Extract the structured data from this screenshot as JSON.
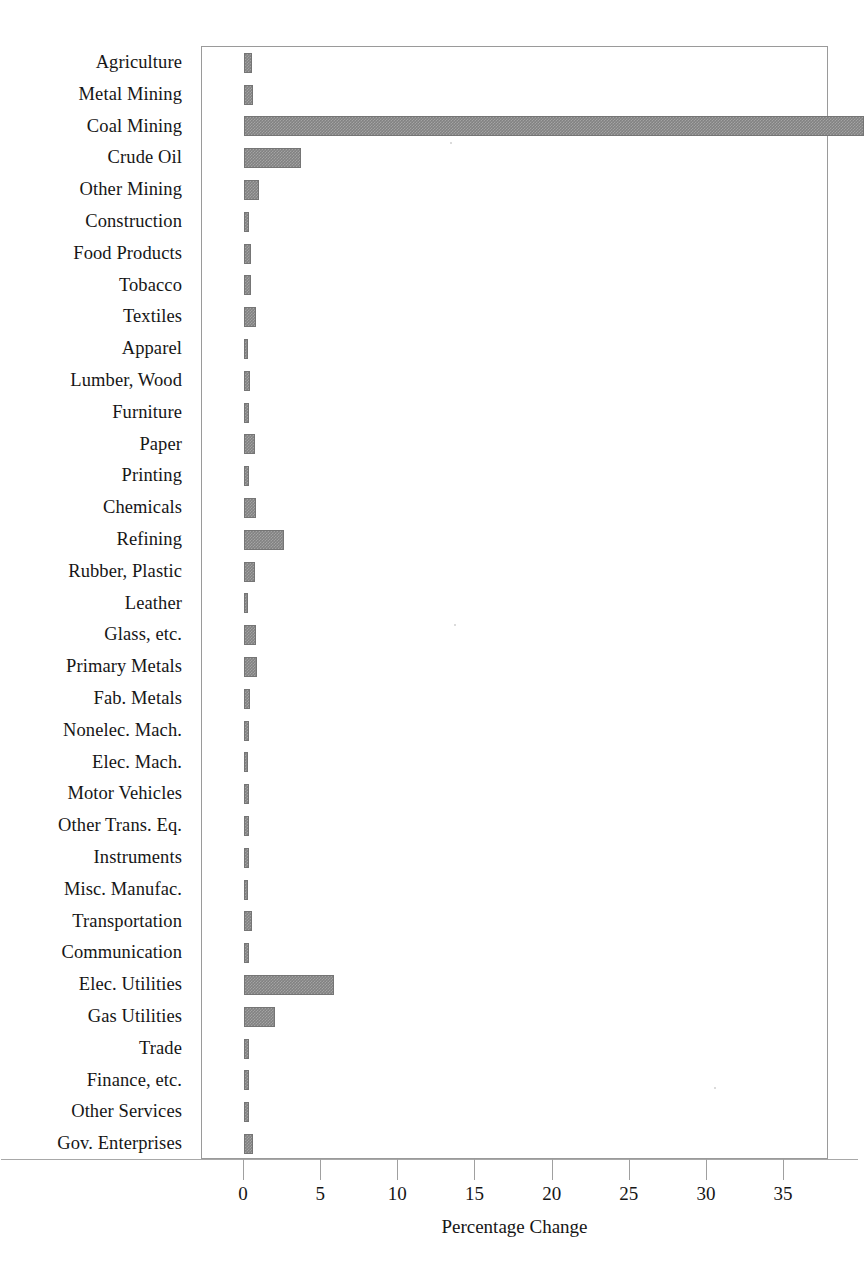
{
  "chart_data": {
    "type": "bar",
    "orientation": "horizontal",
    "title": "",
    "xlabel": "Percentage Change",
    "ylabel": "",
    "xlim": [
      0,
      40.5
    ],
    "xticks": [
      0,
      5,
      10,
      15,
      20,
      25,
      30,
      35
    ],
    "xtick_labels": [
      "0",
      "5",
      "10",
      "15",
      "20",
      "25",
      "30",
      "35"
    ],
    "grid": false,
    "legend": false,
    "bar_color": "#828282",
    "frame_color": "#9a9a9a",
    "categories": [
      "Agriculture",
      "Metal Mining",
      "Coal Mining",
      "Crude Oil",
      "Other Mining",
      "Construction",
      "Food Products",
      "Tobacco",
      "Textiles",
      "Apparel",
      "Lumber, Wood",
      "Furniture",
      "Paper",
      "Printing",
      "Chemicals",
      "Refining",
      "Rubber, Plastic",
      "Leather",
      "Glass, etc.",
      "Primary Metals",
      "Fab. Metals",
      "Nonelec. Mach.",
      "Elec. Mach.",
      "Motor Vehicles",
      "Other Trans. Eq.",
      "Instruments",
      "Misc. Manufac.",
      "Transportation",
      "Communication",
      "Elec. Utilities",
      "Gas Utilities",
      "Trade",
      "Finance, etc.",
      "Other Services",
      "Gov. Enterprises"
    ],
    "values": [
      0.5,
      0.6,
      40.2,
      3.7,
      1.0,
      0.3,
      0.45,
      0.45,
      0.75,
      0.25,
      0.4,
      0.35,
      0.7,
      0.3,
      0.8,
      2.6,
      0.7,
      0.12,
      0.8,
      0.85,
      0.4,
      0.3,
      0.25,
      0.3,
      0.35,
      0.35,
      0.25,
      0.5,
      0.35,
      5.8,
      2.0,
      0.3,
      0.3,
      0.3,
      0.6
    ]
  }
}
